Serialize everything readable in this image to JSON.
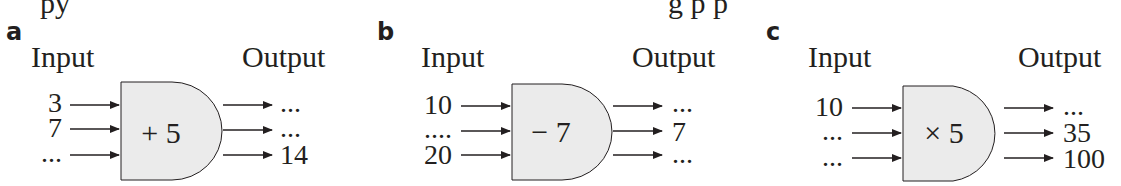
{
  "cutoff_text": [
    "py",
    "g p p"
  ],
  "panels": [
    {
      "letter": "a",
      "input_label": "Input",
      "output_label": "Output",
      "operation": "+ 5",
      "inputs": [
        "3",
        "7",
        "..."
      ],
      "outputs": [
        "...",
        "...",
        "14"
      ]
    },
    {
      "letter": "b",
      "input_label": "Input",
      "output_label": "Output",
      "operation": "− 7",
      "inputs": [
        "10",
        "....",
        "20"
      ],
      "outputs": [
        "...",
        "7",
        "..."
      ]
    },
    {
      "letter": "c",
      "input_label": "Input",
      "output_label": "Output",
      "operation": "× 5",
      "inputs": [
        "10",
        "...",
        "..."
      ],
      "outputs": [
        "...",
        "35",
        "100"
      ]
    }
  ],
  "colors": {
    "gate_fill": "#ebebeb",
    "stroke": "#231f20"
  }
}
